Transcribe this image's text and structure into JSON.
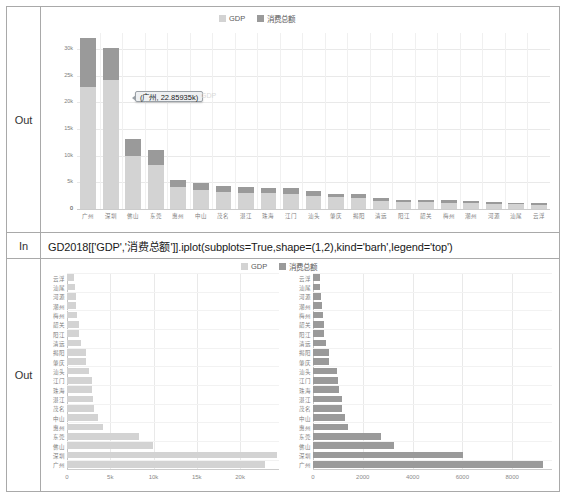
{
  "notebook": {
    "out_label_1": "Out",
    "in_label": "In",
    "out_label_2": "Out",
    "code": "GD2018[['GDP','消费总额']].iplot(subplots=True,shape=(1,2),kind='barh',legend='top')"
  },
  "legend": {
    "series": [
      {
        "name": "GDP",
        "color": "#d3d3d3"
      },
      {
        "name": "消费总额",
        "color": "#9a9a9a"
      }
    ]
  },
  "tooltip": {
    "text": "(广州, 22.85935k)",
    "ghost": "GDP"
  },
  "chart_data": [
    {
      "id": "top-stacked-bar",
      "type": "bar",
      "title": "",
      "xlabel": "",
      "ylabel": "",
      "stacked": true,
      "grid": true,
      "legend_position": "top",
      "ylim": [
        0,
        33000
      ],
      "yticks": [
        0,
        5000,
        10000,
        15000,
        20000,
        25000,
        30000
      ],
      "ytick_labels": [
        "0",
        "5k",
        "10k",
        "15k",
        "20k",
        "25k",
        "30k"
      ],
      "categories": [
        "广州",
        "深圳",
        "佛山",
        "东莞",
        "惠州",
        "中山",
        "茂名",
        "湛江",
        "珠海",
        "江门",
        "汕头",
        "肇庆",
        "揭阳",
        "清远",
        "阳江",
        "韶关",
        "梅州",
        "潮州",
        "河源",
        "汕尾",
        "云浮"
      ],
      "series": [
        {
          "name": "GDP",
          "color": "#d3d3d3",
          "values": [
            22859,
            24222,
            9936,
            8278,
            4103,
            3633,
            3100,
            3008,
            2915,
            2900,
            2512,
            2202,
            2149,
            1565,
            1330,
            1340,
            1210,
            1080,
            1004,
            870,
            820
          ]
        },
        {
          "name": "消费总额",
          "color": "#9a9a9a",
          "values": [
            9256,
            6017,
            3240,
            2750,
            1420,
            1300,
            1170,
            1150,
            1050,
            1000,
            950,
            640,
            630,
            520,
            450,
            430,
            400,
            370,
            330,
            300,
            280
          ]
        }
      ]
    },
    {
      "id": "bottom-left-barh-gdp",
      "type": "bar",
      "orientation": "horizontal",
      "title": "",
      "grid": true,
      "legend_position": "top",
      "xlim": [
        0,
        24500
      ],
      "xticks": [
        0,
        5000,
        10000,
        15000,
        20000
      ],
      "xtick_labels": [
        "0",
        "5k",
        "10k",
        "15k",
        "20k"
      ],
      "categories": [
        "云浮",
        "汕尾",
        "河源",
        "潮州",
        "梅州",
        "韶关",
        "阳江",
        "清远",
        "揭阳",
        "肇庆",
        "汕头",
        "江门",
        "珠海",
        "湛江",
        "茂名",
        "中山",
        "惠州",
        "东莞",
        "佛山",
        "深圳",
        "广州"
      ],
      "series": [
        {
          "name": "GDP",
          "color": "#d3d3d3",
          "values": [
            820,
            870,
            1004,
            1080,
            1210,
            1340,
            1330,
            1565,
            2149,
            2202,
            2512,
            2900,
            2915,
            3008,
            3100,
            3633,
            4103,
            8278,
            9936,
            24222,
            22859
          ]
        }
      ]
    },
    {
      "id": "bottom-right-barh-consumption",
      "type": "bar",
      "orientation": "horizontal",
      "title": "",
      "grid": true,
      "legend_position": "top",
      "xlim": [
        0,
        9600
      ],
      "xticks": [
        0,
        2000,
        4000,
        6000,
        8000
      ],
      "xtick_labels": [
        "0",
        "2000",
        "4000",
        "6000",
        "8000"
      ],
      "categories": [
        "云浮",
        "汕尾",
        "河源",
        "潮州",
        "梅州",
        "韶关",
        "阳江",
        "清远",
        "揭阳",
        "肇庆",
        "汕头",
        "江门",
        "珠海",
        "湛江",
        "茂名",
        "中山",
        "惠州",
        "东莞",
        "佛山",
        "深圳",
        "广州"
      ],
      "series": [
        {
          "name": "消费总额",
          "color": "#9a9a9a",
          "values": [
            280,
            300,
            330,
            370,
            400,
            430,
            450,
            520,
            630,
            640,
            950,
            1000,
            1050,
            1150,
            1170,
            1300,
            1420,
            2750,
            3240,
            6017,
            9256
          ]
        }
      ]
    }
  ]
}
